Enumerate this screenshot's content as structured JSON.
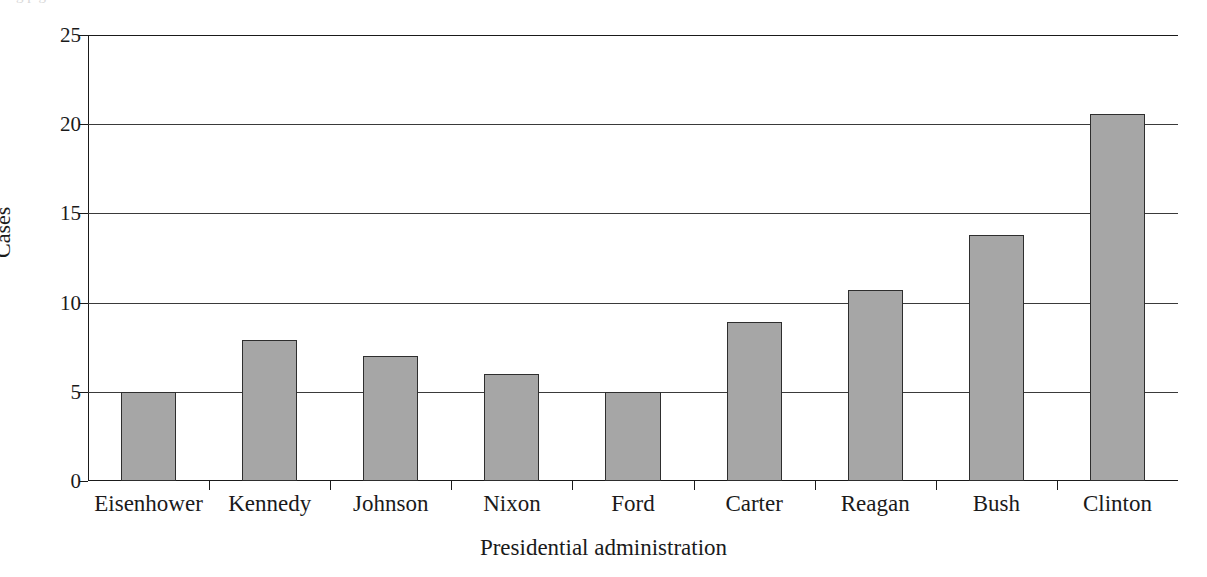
{
  "figure": {
    "caption_remnant": "g         p                                                                        g"
  },
  "chart_data": {
    "type": "bar",
    "title": "",
    "subtitle": "",
    "xlabel": "Presidential administration",
    "ylabel": "Cases",
    "categories": [
      "Eisenhower",
      "Kennedy",
      "Johnson",
      "Nixon",
      "Ford",
      "Carter",
      "Reagan",
      "Bush",
      "Clinton"
    ],
    "values": [
      5,
      7.9,
      7,
      6,
      5,
      8.9,
      10.7,
      13.8,
      20.6
    ],
    "ylim": [
      0,
      25
    ],
    "ytick_labels": [
      "0",
      "5",
      "10",
      "15",
      "20",
      "25"
    ],
    "ytick_values": [
      0,
      5,
      10,
      15,
      20,
      25
    ],
    "grid": "horizontal",
    "legend": "none",
    "bar_fill_color": "#a6a6a6",
    "bar_edge_color": "#2e2e2e",
    "axis_color": "#1a1a1a"
  }
}
